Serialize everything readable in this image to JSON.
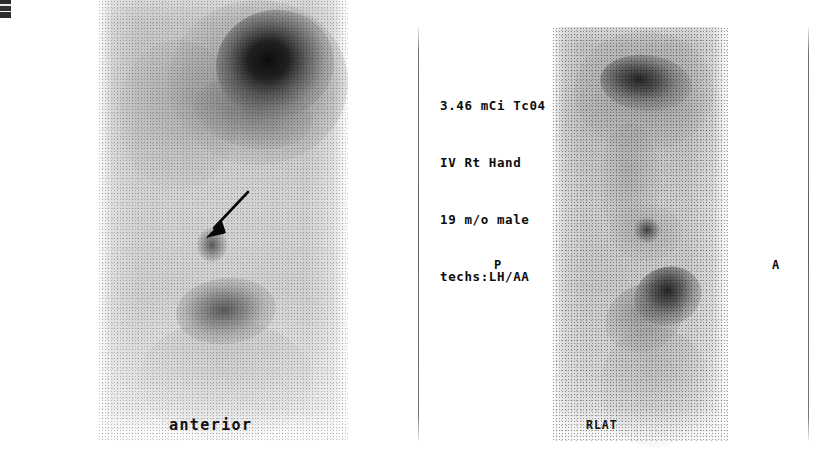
{
  "study": {
    "header_lines": [
      "3.46 mCi Tc04",
      "IV Rt Hand",
      "19 m/o male",
      "techs:LH/AA"
    ],
    "dose": "3.46 mCi",
    "radiotracer": "Tc04",
    "injection_route": "IV Rt Hand",
    "patient": "19 m/o male",
    "technologists": "techs:LH/AA"
  },
  "panels": {
    "left": {
      "view_label": "anterior",
      "arrow_annotation": "arrow-pointing-to-focal-uptake"
    },
    "right": {
      "view_label": "RLAT",
      "orientation_left_marker": "P",
      "orientation_right_marker": "A",
      "arrow_annotation": "arrow-pointing-to-focal-uptake"
    }
  },
  "markers": {
    "film_corner": "film-edge-marker"
  },
  "colors": {
    "background": "#ffffff",
    "ink": "#0d0d0d",
    "divider": "#5f5f5f",
    "hot_uptake": "#0a0a0a",
    "soft_tissue": "#c9c9c9"
  }
}
